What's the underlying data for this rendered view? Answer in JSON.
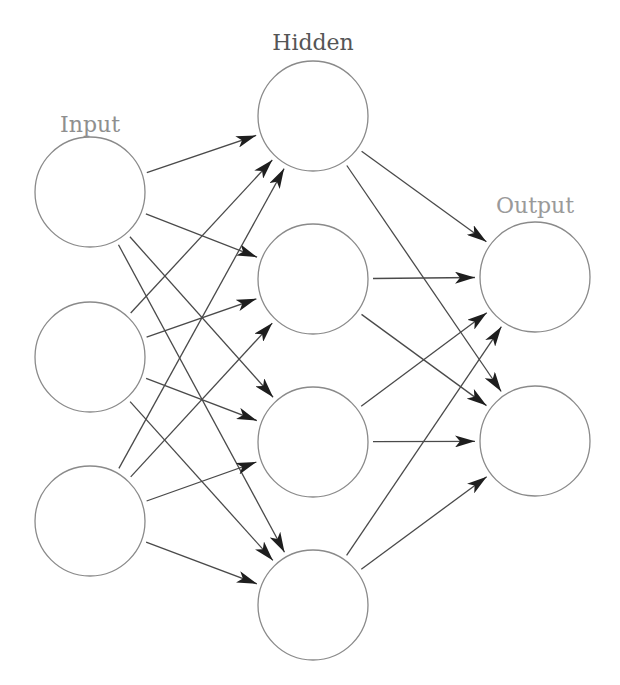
{
  "layers": [
    {
      "id": "input",
      "label": "Input",
      "label_color": "#8f8f8f",
      "label_pos": [
        90,
        132
      ],
      "nodes": [
        {
          "id": "i1",
          "cx": 90,
          "cy": 192
        },
        {
          "id": "i2",
          "cx": 90,
          "cy": 357
        },
        {
          "id": "i3",
          "cx": 90,
          "cy": 521
        }
      ]
    },
    {
      "id": "hidden",
      "label": "Hidden",
      "label_color": "#555555",
      "label_pos": [
        313,
        50
      ],
      "nodes": [
        {
          "id": "h1",
          "cx": 313,
          "cy": 116
        },
        {
          "id": "h2",
          "cx": 313,
          "cy": 279
        },
        {
          "id": "h3",
          "cx": 313,
          "cy": 442
        },
        {
          "id": "h4",
          "cx": 313,
          "cy": 605
        }
      ]
    },
    {
      "id": "output",
      "label": "Output",
      "label_color": "#9a9a9a",
      "label_pos": [
        535,
        213
      ],
      "nodes": [
        {
          "id": "o1",
          "cx": 535,
          "cy": 277
        },
        {
          "id": "o2",
          "cx": 535,
          "cy": 441
        }
      ]
    }
  ],
  "node_radius": 55,
  "edge_gap": 5,
  "connectivity": "fully-connected",
  "edges": [
    [
      "i1",
      "h1"
    ],
    [
      "i1",
      "h2"
    ],
    [
      "i1",
      "h3"
    ],
    [
      "i1",
      "h4"
    ],
    [
      "i2",
      "h1"
    ],
    [
      "i2",
      "h2"
    ],
    [
      "i2",
      "h3"
    ],
    [
      "i2",
      "h4"
    ],
    [
      "i3",
      "h1"
    ],
    [
      "i3",
      "h2"
    ],
    [
      "i3",
      "h3"
    ],
    [
      "i3",
      "h4"
    ],
    [
      "h1",
      "o1"
    ],
    [
      "h1",
      "o2"
    ],
    [
      "h2",
      "o1"
    ],
    [
      "h2",
      "o2"
    ],
    [
      "h3",
      "o1"
    ],
    [
      "h3",
      "o2"
    ],
    [
      "h4",
      "o1"
    ],
    [
      "h4",
      "o2"
    ]
  ],
  "colors": {
    "node_stroke": "#8a8a8a",
    "edge_stroke": "#4a4a4a",
    "arrowhead": "#1e1e1e",
    "background": "#ffffff"
  }
}
